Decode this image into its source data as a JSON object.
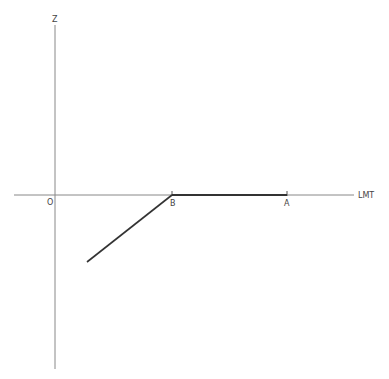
{
  "diagram": {
    "axes": {
      "vertical_label": "Z",
      "horizontal_label": "LMT",
      "origin_label": "O"
    },
    "points": [
      {
        "label": "B"
      },
      {
        "label": "A"
      }
    ],
    "colors": {
      "axis": "#777777",
      "path": "#333333",
      "background": "#ffffff"
    }
  }
}
